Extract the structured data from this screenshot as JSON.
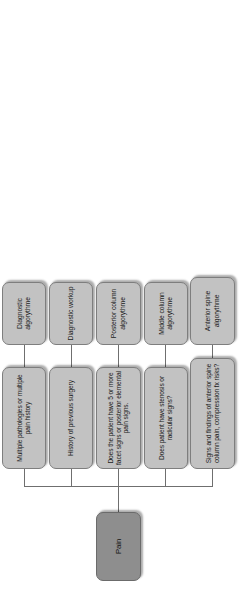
{
  "diagram": {
    "type": "flowchart",
    "orientation": "rotated-90-ccw",
    "colors": {
      "root_fill": "#8e8e8e",
      "node_fill": "#c2c2c2",
      "node_border": "#7e7e7e",
      "connector": "#6f6f6f",
      "background": "#ffffff",
      "text": "#1b1b1b"
    },
    "root": {
      "label": "Pain"
    },
    "branches": [
      {
        "condition": "Signs and findings of anterior spine column pain, compression fx risks?",
        "outcome": "Anterior spine algorythme"
      },
      {
        "condition": "Does patient have stenosis or radicular signs?",
        "outcome": "Middle column algorythme"
      },
      {
        "condition": "Does the patient have 5 or more facet signs or posterior elemental pain signs.",
        "outcome": "Posterior column algorythme"
      },
      {
        "condition": "History of previous surgery",
        "outcome": "Diagnostic workup"
      },
      {
        "condition": "Multiple pathologies or multiple pain history",
        "outcome": "Diagnostic algorythme"
      }
    ]
  }
}
